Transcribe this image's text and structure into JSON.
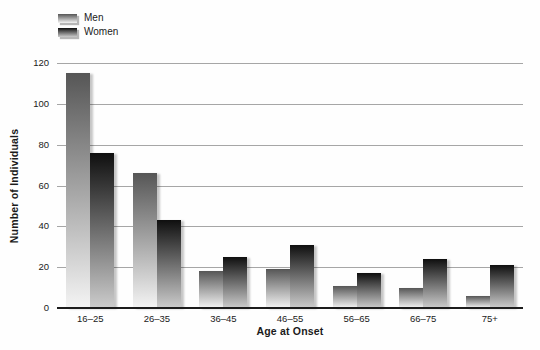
{
  "legend": {
    "items": [
      {
        "label": "Men",
        "series": "men"
      },
      {
        "label": "Women",
        "series": "women"
      }
    ]
  },
  "colors": {
    "men_gradient_top": "#565656",
    "men_gradient_bottom": "#f4f4f4",
    "women_gradient_top": "#0f0f0f",
    "women_gradient_bottom": "#cccccc",
    "gridline": "#a6a6a6",
    "baseline": "#1c1c1c",
    "text": "#1a1a1a"
  },
  "chart_data": {
    "type": "bar",
    "title": "",
    "categories": [
      "16–25",
      "26–35",
      "36–45",
      "46–55",
      "56–65",
      "66–75",
      "75+"
    ],
    "series": [
      {
        "name": "Men",
        "values": [
          115,
          66,
          18,
          19,
          11,
          10,
          6
        ]
      },
      {
        "name": "Women",
        "values": [
          76,
          43,
          25,
          31,
          17,
          24,
          21
        ]
      }
    ],
    "xlabel": "Age at Onset",
    "ylabel": "Number of Individuals",
    "ylim": [
      0,
      120
    ],
    "ytick_interval": 20,
    "grid": true,
    "legend_position": "top-left"
  }
}
